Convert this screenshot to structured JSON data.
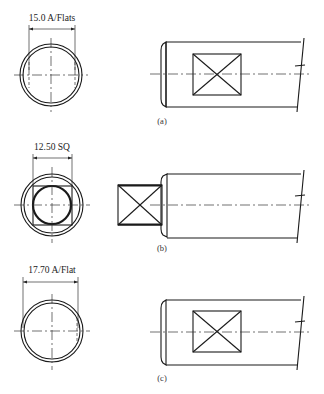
{
  "figure": {
    "views": [
      {
        "id": "a",
        "label": "(a)",
        "dimension": "15.0 A/Flats",
        "end_view": "circle-with-flats",
        "side_view": "shaft-with-square-flat"
      },
      {
        "id": "b",
        "label": "(b)",
        "dimension": "12.50 SQ",
        "end_view": "circle-with-square-tenon",
        "side_view": "shaft-with-square-tenon"
      },
      {
        "id": "c",
        "label": "(c)",
        "dimension": "17.70 A/Flat",
        "end_view": "circle-with-single-flat",
        "side_view": "shaft-with-square-flat"
      }
    ]
  },
  "colors": {
    "line": "#1a1a1a",
    "background": "#ffffff"
  }
}
